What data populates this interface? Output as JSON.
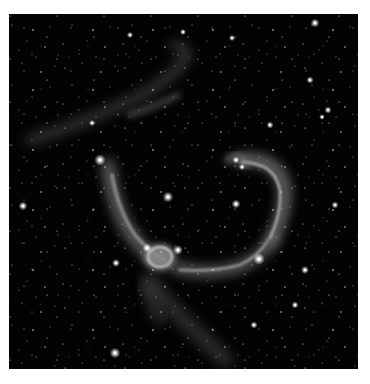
{
  "image": {
    "subject": "emission nebula star field",
    "palette": {
      "background": "#ffffff",
      "sky": "#030303",
      "nebula": "#bdbdbd",
      "star": "#ffffff"
    },
    "bright_stars": [
      {
        "x": 100,
        "y": 160,
        "r": 2.6
      },
      {
        "x": 168,
        "y": 197,
        "r": 2.4
      },
      {
        "x": 236,
        "y": 204,
        "r": 2.0
      },
      {
        "x": 259,
        "y": 259,
        "r": 2.6
      },
      {
        "x": 116,
        "y": 263,
        "r": 1.8
      },
      {
        "x": 147,
        "y": 248,
        "r": 2.0
      },
      {
        "x": 178,
        "y": 250,
        "r": 2.2
      },
      {
        "x": 23,
        "y": 206,
        "r": 2.0
      },
      {
        "x": 115,
        "y": 353,
        "r": 2.4
      },
      {
        "x": 315,
        "y": 23,
        "r": 2.0
      },
      {
        "x": 310,
        "y": 80,
        "r": 1.6
      },
      {
        "x": 328,
        "y": 110,
        "r": 1.6
      },
      {
        "x": 232,
        "y": 38,
        "r": 1.4
      },
      {
        "x": 130,
        "y": 35,
        "r": 1.4
      },
      {
        "x": 183,
        "y": 32,
        "r": 1.4
      },
      {
        "x": 270,
        "y": 125,
        "r": 1.6
      },
      {
        "x": 305,
        "y": 270,
        "r": 1.8
      },
      {
        "x": 295,
        "y": 305,
        "r": 1.6
      },
      {
        "x": 254,
        "y": 325,
        "r": 1.6
      },
      {
        "x": 92,
        "y": 123,
        "r": 1.4
      },
      {
        "x": 236,
        "y": 160,
        "r": 1.6
      },
      {
        "x": 242,
        "y": 167,
        "r": 1.4
      },
      {
        "x": 335,
        "y": 205,
        "r": 1.6
      },
      {
        "x": 322,
        "y": 117,
        "r": 1.3
      }
    ]
  }
}
